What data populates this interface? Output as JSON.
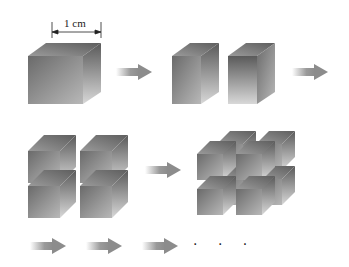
{
  "diagram": {
    "dimension_label": "1 cm",
    "continuation": "· · ·",
    "stages": [
      {
        "name": "single-cube",
        "pieces": 1
      },
      {
        "name": "cube-split-in-two",
        "pieces": 2
      },
      {
        "name": "cube-split-in-four",
        "pieces": 4
      },
      {
        "name": "cube-split-in-eight",
        "pieces": 8
      }
    ],
    "colors": {
      "background": "#ffffff",
      "cube_front_dark": "#6e6e6e",
      "cube_front_light": "#c8c8c8",
      "cube_top": "#8a8a8a",
      "arrow": "#8c8c8c",
      "text": "#222222"
    }
  }
}
